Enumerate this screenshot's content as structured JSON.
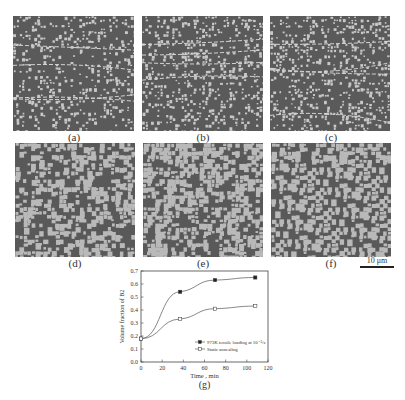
{
  "figure": {
    "panels": [
      {
        "id": "a",
        "label": "(a)",
        "phase": "fine",
        "bg": "#5a5a5a",
        "fg": "#c8c8c8",
        "density": 0.25
      },
      {
        "id": "b",
        "label": "(b)",
        "phase": "fine",
        "bg": "#5a5a5a",
        "fg": "#c8c8c8",
        "density": 0.3
      },
      {
        "id": "c",
        "label": "(c)",
        "phase": "fine",
        "bg": "#5a5a5a",
        "fg": "#c8c8c8",
        "density": 0.32
      },
      {
        "id": "d",
        "label": "(d)",
        "phase": "coarse",
        "bg": "#595959",
        "fg": "#b9b9b9",
        "density": 0.48
      },
      {
        "id": "e",
        "label": "(e)",
        "phase": "coarse",
        "bg": "#595959",
        "fg": "#b9b9b9",
        "density": 0.55
      },
      {
        "id": "f",
        "label": "(f)",
        "phase": "coarse",
        "bg": "#595959",
        "fg": "#b9b9b9",
        "density": 0.62
      }
    ],
    "scale_bar": "10 μm",
    "chart_label": "(g)"
  },
  "chart_data": {
    "type": "line",
    "title": "",
    "xlabel": "Time , min",
    "ylabel": "Volume fraction of B2",
    "xlim": [
      0,
      120
    ],
    "ylim": [
      0.0,
      0.7
    ],
    "xticks": [
      0,
      20,
      40,
      60,
      80,
      100,
      120
    ],
    "yticks": [
      "0.0",
      "0.1",
      "0.2",
      "0.3",
      "0.4",
      "0.5",
      "0.6",
      "0.7"
    ],
    "grid": false,
    "legend_position": "lower right",
    "series": [
      {
        "name": "973K tensile loading at 10⁻³/s",
        "marker": "filled-square",
        "x": [
          0,
          37,
          70,
          108
        ],
        "y": [
          0.18,
          0.54,
          0.63,
          0.65
        ]
      },
      {
        "name": "Static annealing",
        "marker": "open-square",
        "x": [
          0,
          37,
          70,
          108
        ],
        "y": [
          0.18,
          0.33,
          0.41,
          0.43
        ]
      }
    ]
  }
}
